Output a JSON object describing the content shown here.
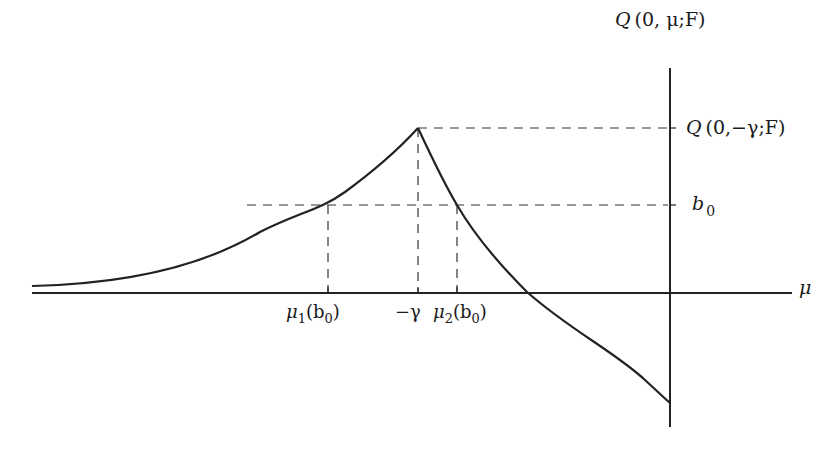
{
  "diagram": {
    "colors": {
      "ink": "#222222",
      "background": "#ffffff"
    },
    "axes": {
      "x_label": "μ",
      "y_label": {
        "Q": "Q",
        "rest": "(0, μ;F)"
      }
    },
    "y_ticks": [
      {
        "name": "peak",
        "Q": "Q",
        "rest": "(0,−γ;F)"
      },
      {
        "name": "b0",
        "base": "b",
        "sub": "0"
      }
    ],
    "x_ticks": [
      {
        "name": "mu1",
        "base": "μ",
        "sub": "1",
        "arg": "(b",
        "argsub": "0",
        "close": ")"
      },
      {
        "name": "minus-gamma",
        "text": "−γ"
      },
      {
        "name": "mu2",
        "base": "μ",
        "sub": "2",
        "arg": "(b",
        "argsub": "0",
        "close": ")"
      }
    ]
  }
}
